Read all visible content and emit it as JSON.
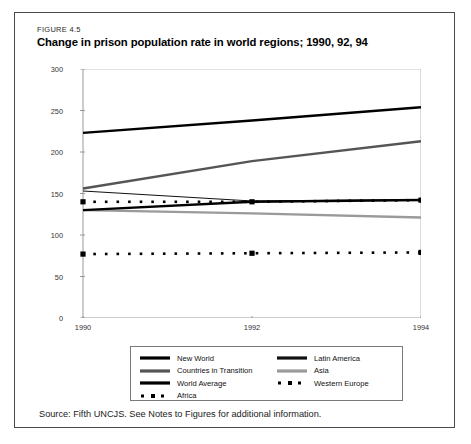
{
  "figure": {
    "label": "FIGURE 4.5",
    "title": "Change in prison population rate in world regions; 1990, 92, 94",
    "source_note": "Source: Fifth UNCJS. See Notes to Figures for additional information."
  },
  "legend": {
    "left": [
      {
        "label": "New World",
        "style": "solid-thick",
        "color": "#000000"
      },
      {
        "label": "Countries in Transition",
        "style": "solid-thick",
        "color": "#555555"
      },
      {
        "label": "World Average",
        "style": "solid-thick",
        "color": "#000000"
      },
      {
        "label": "Africa",
        "style": "dotted-square",
        "color": "#000000"
      }
    ],
    "right": [
      {
        "label": "Latin America",
        "style": "solid-thick",
        "color": "#111111"
      },
      {
        "label": "Asia",
        "style": "solid-thick",
        "color": "#9a9a9a"
      },
      {
        "label": "Western Europe",
        "style": "dotted-square",
        "color": "#000000"
      }
    ]
  },
  "chart_data": {
    "type": "line",
    "title": "Change in prison population rate in world regions; 1990, 92, 94",
    "xlabel": "",
    "ylabel": "",
    "x": [
      1990,
      1992,
      1994
    ],
    "tick_labels_x": [
      "1990",
      "1992",
      "1994"
    ],
    "tick_labels_y": [
      "0",
      "50",
      "100",
      "150",
      "200",
      "250",
      "300"
    ],
    "ylim": [
      0,
      300
    ],
    "yticks": [
      0,
      50,
      100,
      150,
      200,
      250,
      300
    ],
    "grid": false,
    "legend_position": "bottom",
    "series": [
      {
        "name": "New World",
        "values": [
          223,
          238,
          254
        ],
        "color": "#000000",
        "style": "solid-thick"
      },
      {
        "name": "Countries in Transition",
        "values": [
          156,
          189,
          213
        ],
        "color": "#555555",
        "style": "solid-thick"
      },
      {
        "name": "World Average",
        "values": [
          130,
          140,
          142
        ],
        "color": "#000000",
        "style": "solid-thick"
      },
      {
        "name": "Africa",
        "values": [
          77,
          78,
          79
        ],
        "color": "#000000",
        "style": "dotted-square"
      },
      {
        "name": "Latin America",
        "values": [
          153,
          141,
          143
        ],
        "color": "#111111",
        "style": "solid-thin"
      },
      {
        "name": "Asia",
        "values": [
          130,
          126,
          121
        ],
        "color": "#9a9a9a",
        "style": "solid-thick"
      },
      {
        "name": "Western Europe",
        "values": [
          140,
          140,
          142
        ],
        "color": "#000000",
        "style": "dotted-square"
      }
    ]
  }
}
